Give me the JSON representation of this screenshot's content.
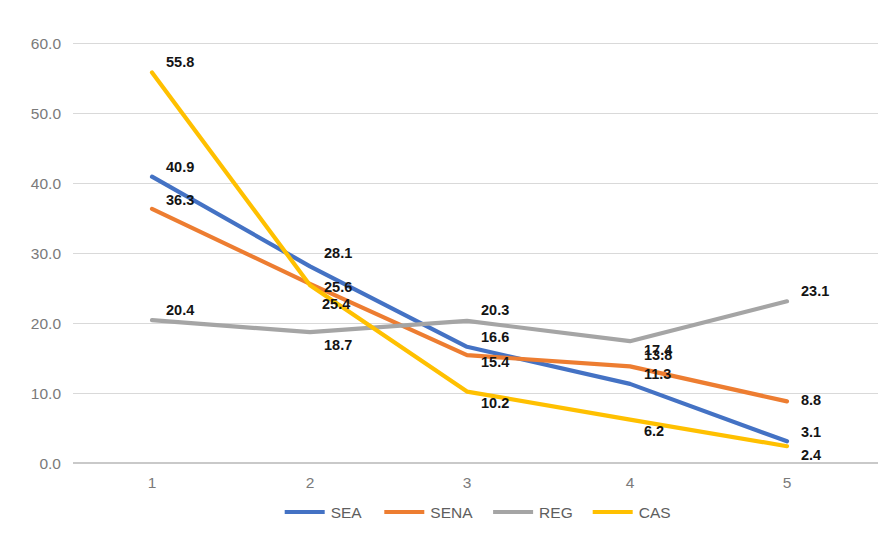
{
  "chart_data": {
    "type": "line",
    "title": "",
    "xlabel": "",
    "ylabel": "",
    "categories": [
      "1",
      "2",
      "3",
      "4",
      "5"
    ],
    "ylim": [
      0,
      60
    ],
    "ytick_labels": [
      "0.0",
      "10.0",
      "20.0",
      "30.0",
      "40.0",
      "50.0",
      "60.0"
    ],
    "ytick_values": [
      0,
      10,
      20,
      30,
      40,
      50,
      60
    ],
    "grid": true,
    "legend_position": "bottom",
    "data_labels": true,
    "series": [
      {
        "name": "SEA",
        "color": "#4472C4",
        "values": [
          40.9,
          28.1,
          16.6,
          11.3,
          3.1
        ],
        "labels": [
          "40.9",
          "28.1",
          "16.6",
          "11.3",
          "3.1"
        ]
      },
      {
        "name": "SENA",
        "color": "#ED7D31",
        "values": [
          36.3,
          25.6,
          15.4,
          13.8,
          8.8
        ],
        "labels": [
          "36.3",
          "25.6",
          "15.4",
          "13.8",
          "8.8"
        ]
      },
      {
        "name": "REG",
        "color": "#A5A5A5",
        "values": [
          20.4,
          18.7,
          20.3,
          17.4,
          23.1
        ],
        "labels": [
          "20.4",
          "18.7",
          "20.3",
          "17.4",
          "23.1"
        ]
      },
      {
        "name": "CAS",
        "color": "#FFC000",
        "values": [
          55.8,
          25.4,
          10.2,
          6.2,
          2.4
        ],
        "labels": [
          "55.8",
          "25.4",
          "10.2",
          "6.2",
          "2.4"
        ]
      }
    ]
  },
  "legend": {
    "items": [
      {
        "label": "SEA",
        "color": "#4472C4"
      },
      {
        "label": "SENA",
        "color": "#ED7D31"
      },
      {
        "label": "REG",
        "color": "#A5A5A5"
      },
      {
        "label": "CAS",
        "color": "#FFC000"
      }
    ]
  }
}
